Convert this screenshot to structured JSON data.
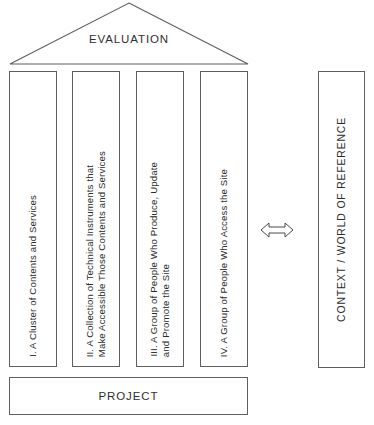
{
  "diagram": {
    "type": "architecture-metaphor-diagram",
    "roof": {
      "label": "EVALUATION",
      "shape": "triangle-pediment"
    },
    "pillars": [
      {
        "id": "pillar-1",
        "numeral": "I.",
        "lines": [
          "I. A Cluster of Contents and Services"
        ]
      },
      {
        "id": "pillar-2",
        "numeral": "II.",
        "lines": [
          "II. A Collection of Technical Instruments that",
          "Make Accessible Those Contents and Services"
        ]
      },
      {
        "id": "pillar-3",
        "numeral": "III.",
        "lines": [
          "III. A Group of People Who Produce, Update",
          "and Promote the Site"
        ]
      },
      {
        "id": "pillar-4",
        "numeral": "IV.",
        "lines": [
          "IV. A Group of People Who Access the Site"
        ]
      }
    ],
    "context": {
      "label": "CONTEXT  /  WORLD OF REFERENCE"
    },
    "connector": {
      "icon_name": "double-headed-arrow-icon",
      "direction": "bidirectional"
    },
    "base": {
      "label": "PROJECT"
    },
    "colors": {
      "stroke": "#5e5e5e",
      "text": "#2b2b2b",
      "background": "#ffffff"
    }
  }
}
